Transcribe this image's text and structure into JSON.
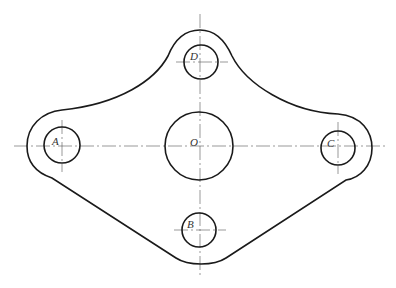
{
  "diagram": {
    "type": "mechanical plate drawing",
    "points": [
      {
        "id": "A",
        "label": "A",
        "cx": 62,
        "cy": 145,
        "r": 18
      },
      {
        "id": "B",
        "label": "B",
        "cx": 199,
        "cy": 230,
        "r": 17
      },
      {
        "id": "C",
        "label": "C",
        "cx": 338,
        "cy": 148,
        "r": 17
      },
      {
        "id": "D",
        "label": "D",
        "cx": 201,
        "cy": 62,
        "r": 17
      },
      {
        "id": "O",
        "label": "O",
        "cx": 199,
        "cy": 146,
        "r": 34
      }
    ]
  }
}
